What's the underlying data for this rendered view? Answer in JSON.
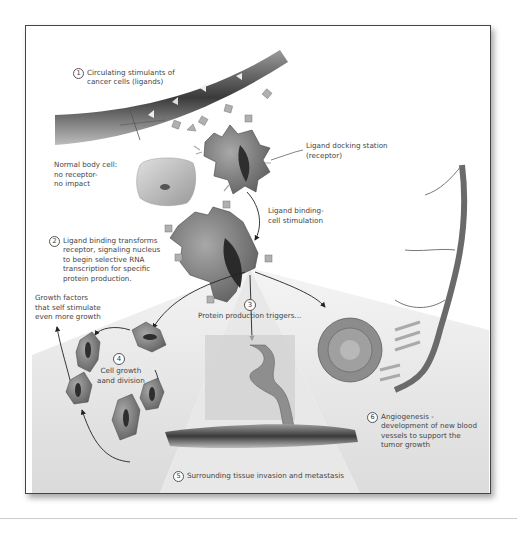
{
  "diagram": {
    "steps": [
      {
        "number": "1",
        "text": "Circulating stimulants of\ncancer cells (ligands)"
      },
      {
        "number": "2",
        "text": "Ligand binding transforms\nreceptor, signaling nucleus\nto begin selective RNA\ntranscription for specific\nprotein production."
      },
      {
        "number": "3",
        "text": "Protein production triggers..."
      },
      {
        "number": "4",
        "text": "Cell growth\naand division"
      },
      {
        "number": "5",
        "text": "Surrounding tissue invasion and metastasis"
      },
      {
        "number": "6",
        "text": "Angiogenesis -\ndevelopment of new blood\nvessels to support the\ntumor growth"
      }
    ],
    "annotations": {
      "normal_cell": "Normal body cell:\nno receptor-\nno impact",
      "receptor": "Ligand docking station\n(receptor)",
      "binding": "Ligand binding-\ncell stimulation",
      "growth_factors": "Growth factors\nthat self stimulate\neven more growth"
    },
    "colors": {
      "frame_border": "#444444",
      "cell_fill": "#8a8a8a",
      "nucleus": "#2e2e2e",
      "ligand": "#b0b0b0",
      "vessel": "#6a6a6a",
      "text": "#444444"
    }
  }
}
